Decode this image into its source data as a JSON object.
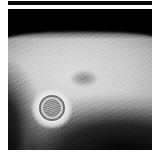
{
  "panel": {
    "modality_label": "grayscale-ultrasound",
    "background_color": "#000000",
    "page_background": "#ffffff",
    "header_bar_color": "#0a0a0a"
  },
  "image": {
    "tissue_label": "hyperechoic-tissue-mass",
    "tissue_peak_color": "#d6d6d6",
    "tissue_mid_color": "#b0b0b0",
    "shadow_color": "#000000",
    "nodule_label": "hypoechoic-nodule",
    "nodule_color": "#767676",
    "lesion_label": "target-sign-lesion",
    "lesion_ring_bright_color": "#e8e8e8",
    "lesion_ring_dark_color": "#6e6e6e",
    "lesion_core_color": "#8a8a8a"
  }
}
